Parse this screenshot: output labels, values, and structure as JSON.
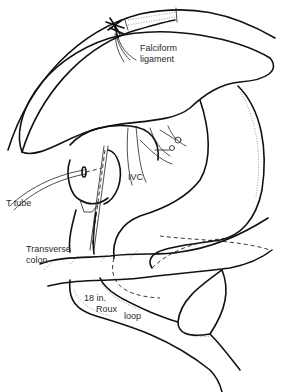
{
  "figure": {
    "type": "surgical-illustration",
    "labels": {
      "falciform_line1": "Falciform",
      "falciform_line2": "ligament",
      "ivc": "IVC",
      "t_tube": "T tube",
      "transverse_line1": "Transverse",
      "transverse_line2": "colon",
      "roux_line1": "18 in.",
      "roux_line2": "Roux",
      "roux_line3": "loop"
    },
    "colors": {
      "ink": "#111111",
      "background": "#ffffff",
      "label_text": "#2a2a2a"
    }
  }
}
